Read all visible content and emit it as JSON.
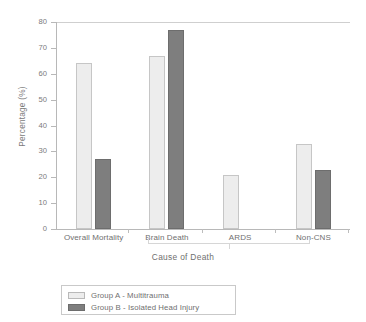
{
  "chart_data": {
    "type": "bar",
    "title": "",
    "xlabel": "Cause of Death",
    "ylabel": "Percentage (%)",
    "categories": [
      "Overall Mortality",
      "Brain Death",
      "ARDS",
      "Non-CNS"
    ],
    "series": [
      {
        "name": "Group A - Multitrauma",
        "color": "#ededed",
        "values": [
          64,
          67,
          21,
          33
        ]
      },
      {
        "name": "Group B - Isolated Head Injury",
        "color": "#7e7e7e",
        "values": [
          27,
          77,
          0,
          23
        ]
      }
    ],
    "ylim": [
      0,
      80
    ],
    "yticks": [
      0,
      10,
      20,
      30,
      40,
      50,
      60,
      70,
      80
    ],
    "ytick_labels": [
      "0",
      "10",
      "20",
      "30",
      "40",
      "50",
      "60",
      "70",
      "80"
    ],
    "grid": false,
    "legend_position": "below-left"
  },
  "legend": {
    "entries": [
      {
        "label": "Group A - Multitrauma"
      },
      {
        "label": "Group B - Isolated Head Injury"
      }
    ]
  }
}
